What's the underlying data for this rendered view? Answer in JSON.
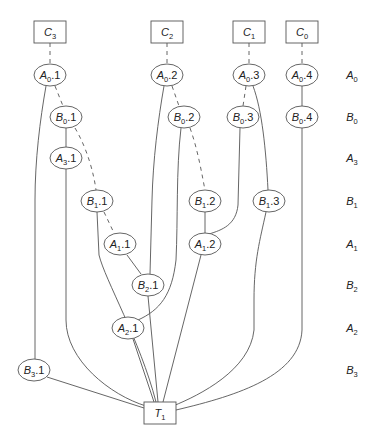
{
  "diagram": {
    "type": "dag",
    "nodes": [
      {
        "id": "C3",
        "base": "C",
        "sub": "3",
        "suffix": "",
        "shape": "box"
      },
      {
        "id": "C2",
        "base": "C",
        "sub": "2",
        "suffix": "",
        "shape": "box"
      },
      {
        "id": "C1",
        "base": "C",
        "sub": "1",
        "suffix": "",
        "shape": "box"
      },
      {
        "id": "C0",
        "base": "C",
        "sub": "0",
        "suffix": "",
        "shape": "box"
      },
      {
        "id": "A0.1",
        "base": "A",
        "sub": "0",
        "suffix": ".1",
        "shape": "ellipse"
      },
      {
        "id": "A0.2",
        "base": "A",
        "sub": "0",
        "suffix": ".2",
        "shape": "ellipse"
      },
      {
        "id": "A0.3",
        "base": "A",
        "sub": "0",
        "suffix": ".3",
        "shape": "ellipse"
      },
      {
        "id": "A0.4",
        "base": "A",
        "sub": "0",
        "suffix": ".4",
        "shape": "ellipse"
      },
      {
        "id": "B0.1",
        "base": "B",
        "sub": "0",
        "suffix": ".1",
        "shape": "ellipse"
      },
      {
        "id": "B0.2",
        "base": "B",
        "sub": "0",
        "suffix": ".2",
        "shape": "ellipse"
      },
      {
        "id": "B0.3",
        "base": "B",
        "sub": "0",
        "suffix": ".3",
        "shape": "ellipse"
      },
      {
        "id": "B0.4",
        "base": "B",
        "sub": "0",
        "suffix": ".4",
        "shape": "ellipse"
      },
      {
        "id": "A3.1",
        "base": "A",
        "sub": "3",
        "suffix": ".1",
        "shape": "ellipse"
      },
      {
        "id": "B1.1",
        "base": "B",
        "sub": "1",
        "suffix": ".1",
        "shape": "ellipse"
      },
      {
        "id": "B1.2",
        "base": "B",
        "sub": "1",
        "suffix": ".2",
        "shape": "ellipse"
      },
      {
        "id": "B1.3",
        "base": "B",
        "sub": "1",
        "suffix": ".3",
        "shape": "ellipse"
      },
      {
        "id": "A1.1",
        "base": "A",
        "sub": "1",
        "suffix": ".1",
        "shape": "ellipse"
      },
      {
        "id": "A1.2",
        "base": "A",
        "sub": "1",
        "suffix": ".2",
        "shape": "ellipse"
      },
      {
        "id": "B2.1",
        "base": "B",
        "sub": "2",
        "suffix": ".1",
        "shape": "ellipse"
      },
      {
        "id": "A2.1",
        "base": "A",
        "sub": "2",
        "suffix": ".1",
        "shape": "ellipse"
      },
      {
        "id": "B3.1",
        "base": "B",
        "sub": "3",
        "suffix": ".1",
        "shape": "ellipse"
      },
      {
        "id": "T1",
        "base": "T",
        "sub": "1",
        "suffix": "",
        "shape": "box"
      }
    ],
    "edges": [
      {
        "from": "C3",
        "to": "A0.1",
        "style": "dashed"
      },
      {
        "from": "C2",
        "to": "A0.2",
        "style": "dashed"
      },
      {
        "from": "C1",
        "to": "A0.3",
        "style": "dashed"
      },
      {
        "from": "C0",
        "to": "A0.4",
        "style": "dashed"
      },
      {
        "from": "A0.1",
        "to": "B0.1",
        "style": "dashed"
      },
      {
        "from": "A0.2",
        "to": "B0.2",
        "style": "dashed"
      },
      {
        "from": "A0.3",
        "to": "B0.3",
        "style": "dashed"
      },
      {
        "from": "A0.4",
        "to": "B0.4",
        "style": "solid"
      },
      {
        "from": "A0.1",
        "to": "B3.1",
        "style": "solid"
      },
      {
        "from": "B0.1",
        "to": "A3.1",
        "style": "solid"
      },
      {
        "from": "B0.1",
        "to": "B1.1",
        "style": "dashed"
      },
      {
        "from": "B0.2",
        "to": "B1.2",
        "style": "dashed"
      },
      {
        "from": "A0.2",
        "to": "B2.1",
        "style": "solid"
      },
      {
        "from": "B0.2",
        "to": "A2.1",
        "style": "solid"
      },
      {
        "from": "B0.3",
        "to": "A1.2",
        "style": "solid"
      },
      {
        "from": "A0.3",
        "to": "B1.3",
        "style": "solid"
      },
      {
        "from": "B1.1",
        "to": "A1.1",
        "style": "dashed"
      },
      {
        "from": "B1.2",
        "to": "A1.2",
        "style": "solid"
      },
      {
        "from": "A1.1",
        "to": "B2.1",
        "style": "solid"
      },
      {
        "from": "B1.1",
        "to": "T1",
        "style": "solid"
      },
      {
        "from": "A3.1",
        "to": "T1",
        "style": "solid"
      },
      {
        "from": "B2.1",
        "to": "T1",
        "style": "solid"
      },
      {
        "from": "A2.1",
        "to": "T1",
        "style": "solid"
      },
      {
        "from": "A1.2",
        "to": "T1",
        "style": "solid"
      },
      {
        "from": "B1.3",
        "to": "T1",
        "style": "solid"
      },
      {
        "from": "B0.4",
        "to": "T1",
        "style": "solid"
      },
      {
        "from": "B3.1",
        "to": "T1",
        "style": "solid"
      }
    ],
    "row_labels": [
      {
        "base": "A",
        "sub": "0"
      },
      {
        "base": "B",
        "sub": "0"
      },
      {
        "base": "A",
        "sub": "3"
      },
      {
        "base": "B",
        "sub": "1"
      },
      {
        "base": "A",
        "sub": "1"
      },
      {
        "base": "B",
        "sub": "2"
      },
      {
        "base": "A",
        "sub": "2"
      },
      {
        "base": "B",
        "sub": "3"
      }
    ]
  }
}
